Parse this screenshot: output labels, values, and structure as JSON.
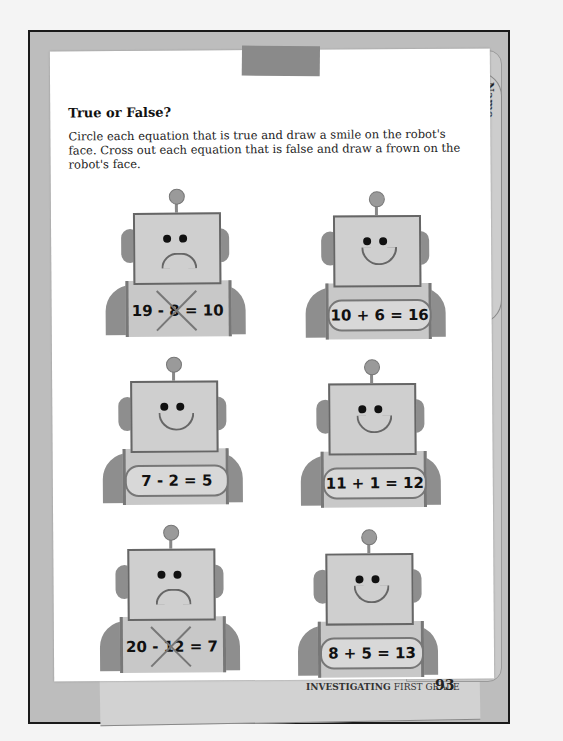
{
  "page": {
    "title": "True or False?",
    "instructions": "Circle each equation that is true and draw a smile on the robot's face. Cross out each equation that is false and draw a frown on the robot's face.",
    "name_label": "Name"
  },
  "robots": [
    {
      "equation": "19 - 8 = 10",
      "face": "frown",
      "mark": "crossed"
    },
    {
      "equation": "10 + 6 = 16",
      "face": "smile",
      "mark": "circled"
    },
    {
      "equation": "7 - 2 = 5",
      "face": "smile",
      "mark": "circled"
    },
    {
      "equation": "11 + 1 = 12",
      "face": "smile",
      "mark": "circled"
    },
    {
      "equation": "20 - 12 = 7",
      "face": "frown",
      "mark": "crossed"
    },
    {
      "equation": "8 + 5 = 13",
      "face": "smile",
      "mark": "circled"
    }
  ],
  "footer": {
    "series": "INVESTIGATING",
    "grade": "FIRST GRADE",
    "page_number": "93"
  }
}
